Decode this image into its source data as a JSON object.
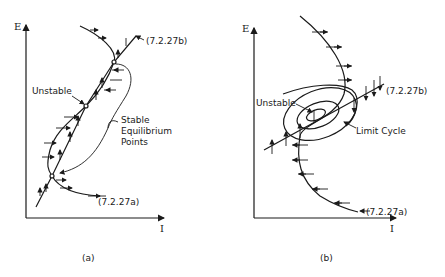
{
  "panel_a": {
    "y_axis_label": "E",
    "x_axis_label": "I",
    "caption": "(a)",
    "curve_b_label": "(7.2.27b)",
    "curve_a_label": "(7.2.27a)",
    "unstable_label": "Unstable",
    "stable_label_line1": "Stable",
    "stable_label_line2": "Equilibrium",
    "stable_label_line3": "Points"
  },
  "panel_b": {
    "y_axis_label": "E",
    "x_axis_label": "I",
    "caption": "(b)",
    "curve_b_label": "(7.2.27b)",
    "curve_a_label": "(7.2.27a)",
    "unstable_label": "Unstable",
    "limit_cycle_label": "Limit Cycle"
  },
  "colors": {
    "ink": "#1a1a1a",
    "background": "#ffffff"
  }
}
